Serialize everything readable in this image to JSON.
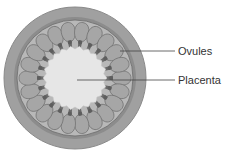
{
  "diagram": {
    "labels": [
      {
        "id": "ovules",
        "text": "Ovules"
      },
      {
        "id": "placenta",
        "text": "Placenta"
      }
    ],
    "colors": {
      "outer_wall": "#9a9a9a",
      "wall_ring": "#7a7a7a",
      "locule": "#b4b4b4",
      "ovule": "#a8a8a8",
      "ovule_stroke": "#6e6e6e",
      "placenta": "#e6e6e6",
      "funicle": "#6a6a6a",
      "leader_line": "#444444"
    }
  }
}
